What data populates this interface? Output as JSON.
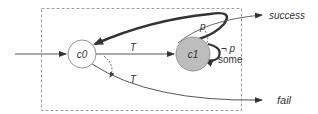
{
  "diagram": {
    "states": [
      {
        "id": "c0",
        "label": "c0",
        "fill": "#ffffff"
      },
      {
        "id": "c1",
        "label": "c1",
        "fill": "#bdbdbd"
      }
    ],
    "outcomes": {
      "success": "success",
      "fail": "fail"
    },
    "edges": {
      "c0_to_c1": "T",
      "c0_to_fail": "T",
      "c1_to_success": "p",
      "c1_self_loop_guard": "¬ p",
      "c1_self_loop_mode": "some"
    },
    "colors": {
      "stroke": "#555555",
      "thick_stroke": "#333333",
      "state_c1_fill": "#bdbdbd",
      "box_dash": "#888888"
    }
  }
}
